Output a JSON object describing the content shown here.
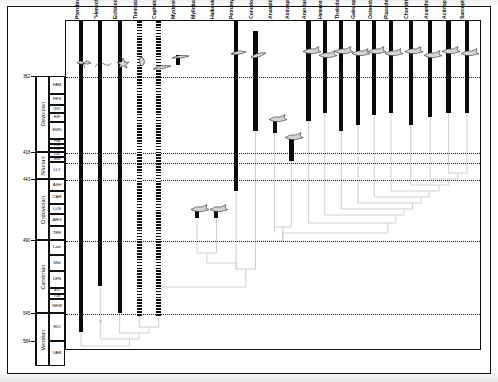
{
  "figure": {
    "type": "stratigraphic-range-cladogram",
    "axis_unit": "Ma",
    "bar_legend": {
      "solid": "known fossil record",
      "hatched": "uncertain / inferred record",
      "ghost": "ghost lineage"
    }
  },
  "age_ticks": [
    {
      "label": "362",
      "y": 76
    },
    {
      "label": "418",
      "y": 152
    },
    {
      "label": "443",
      "y": 179
    },
    {
      "label": "490",
      "y": 240
    },
    {
      "label": "545",
      "y": 313
    },
    {
      "label": "584",
      "y": 341
    }
  ],
  "periods": [
    {
      "name": "Devonian",
      "top": 76,
      "bottom": 152
    },
    {
      "name": "Silurian",
      "top": 152,
      "bottom": 179
    },
    {
      "name": "Ordovician",
      "top": 179,
      "bottom": 240
    },
    {
      "name": "Cambrian",
      "top": 240,
      "bottom": 313
    },
    {
      "name": "Vendian",
      "top": 313,
      "bottom": 366
    }
  ],
  "stages": [
    {
      "label": "FAM",
      "top": 76,
      "bottom": 94
    },
    {
      "label": "FRS",
      "top": 94,
      "bottom": 105
    },
    {
      "label": "GIV",
      "top": 105,
      "bottom": 113
    },
    {
      "label": "EIF",
      "top": 113,
      "bottom": 122
    },
    {
      "label": "EMS",
      "top": 122,
      "bottom": 139
    },
    {
      "label": "PRA",
      "top": 139,
      "bottom": 144,
      "tiny": true
    },
    {
      "label": "LOK",
      "top": 144,
      "bottom": 148,
      "tiny": true
    },
    {
      "label": "PRD",
      "top": 148,
      "bottom": 152,
      "tiny": true
    },
    {
      "label": "LUD",
      "top": 152,
      "bottom": 157,
      "tiny": true
    },
    {
      "label": "WEN",
      "top": 157,
      "bottom": 162,
      "tiny": true
    },
    {
      "label": "LLY",
      "top": 162,
      "bottom": 179
    },
    {
      "label": "ASH",
      "top": 179,
      "bottom": 191
    },
    {
      "label": "CAR",
      "top": 191,
      "bottom": 204
    },
    {
      "label": "LLN",
      "top": 204,
      "bottom": 214
    },
    {
      "label": "ARG",
      "top": 214,
      "bottom": 226
    },
    {
      "label": "TRE",
      "top": 226,
      "bottom": 240
    },
    {
      "label": "Late",
      "top": 240,
      "bottom": 255
    },
    {
      "label": "Mid",
      "top": 255,
      "bottom": 271
    },
    {
      "label": "LEN",
      "top": 271,
      "bottom": 288
    },
    {
      "label": "ATD",
      "top": 288,
      "bottom": 294,
      "tiny": true
    },
    {
      "label": "TOM",
      "top": 294,
      "bottom": 299,
      "tiny": true
    },
    {
      "label": "NEM",
      "top": 299,
      "bottom": 313
    },
    {
      "label": "EDI",
      "top": 313,
      "bottom": 341
    },
    {
      "label": "VAR",
      "top": 341,
      "bottom": 366
    }
  ],
  "boundaries_y": [
    76,
    152,
    162,
    179,
    240,
    313
  ],
  "taxa": [
    {
      "name": "Pterobranchia",
      "x": 18,
      "bar_top": 0,
      "bar_bottom": 311,
      "style": "solid",
      "width": 4.0,
      "critter": "plume",
      "critter_y": 36
    },
    {
      "name": "\"Hemichordata\"",
      "x": 45,
      "bar_top": 0,
      "bar_bottom": 265,
      "style": "solid",
      "width": 4.0,
      "critter": "worm",
      "critter_y": 38
    },
    {
      "name": "Echinodermata",
      "x": 72,
      "bar_top": 0,
      "bar_bottom": 292,
      "style": "solid",
      "width": 4.0,
      "critter": "star",
      "critter_y": 36
    },
    {
      "name": "Tunicata",
      "x": 99,
      "bar_top": 0,
      "bar_bottom": 295,
      "style": "hatch",
      "width": 4.6,
      "critter": "tunic",
      "critter_y": 34
    },
    {
      "name": "Cephalochordata",
      "x": 126,
      "bar_top": 0,
      "bar_bottom": 296,
      "style": "hatch",
      "width": 4.6,
      "critter": "lance",
      "critter_y": 40
    },
    {
      "name": "Myxinoidea",
      "x": 153,
      "bar_top": 34,
      "bar_bottom": 44,
      "style": "solid",
      "width": 4.0,
      "critter": "hag",
      "critter_y": 30
    },
    {
      "name": "Myllokunmingia",
      "x": 180,
      "bar_top": 190,
      "bar_bottom": 197,
      "style": "solid",
      "width": 4.0,
      "critter": "fish1",
      "critter_y": 182
    },
    {
      "name": "Haikouichthys",
      "x": 207,
      "bar_top": 190,
      "bar_bottom": 197,
      "style": "solid",
      "width": 4.0,
      "critter": "fish1",
      "critter_y": 182
    },
    {
      "name": "Petromyzontida",
      "x": 234,
      "bar_top": 0,
      "bar_bottom": 170,
      "style": "solid",
      "width": 4.6,
      "critter": "lamp",
      "critter_y": 26
    },
    {
      "name": "Conodonta",
      "x": 261,
      "bar_top": 10,
      "bar_bottom": 110,
      "style": "solid",
      "width": 4.6,
      "critter": "cono",
      "critter_y": 28
    },
    {
      "name": "Anaspida",
      "x": 288,
      "bar_top": 100,
      "bar_bottom": 112,
      "style": "solid",
      "width": 4.0,
      "critter": "anas",
      "critter_y": 92
    },
    {
      "name": "Astraspida",
      "x": 311,
      "bar_top": 117,
      "bar_bottom": 140,
      "style": "solid",
      "width": 4.6,
      "critter": "astr",
      "critter_y": 110
    },
    {
      "name": "Arandaspida",
      "x": 335,
      "bar_top": 0,
      "bar_bottom": 100,
      "style": "solid",
      "width": 4.6,
      "critter": "aran",
      "critter_y": 24
    },
    {
      "name": "Heterostraci",
      "x": 358,
      "bar_top": 0,
      "bar_bottom": 92,
      "style": "solid",
      "width": 4.0,
      "critter": "het",
      "critter_y": 28
    },
    {
      "name": "Thelodonti",
      "x": 381,
      "bar_top": 0,
      "bar_bottom": 110,
      "style": "solid",
      "width": 4.0,
      "critter": "thel",
      "critter_y": 24
    },
    {
      "name": "Galeaspida",
      "x": 404,
      "bar_top": 0,
      "bar_bottom": 104,
      "style": "solid",
      "width": 4.6,
      "critter": "gale",
      "critter_y": 26
    },
    {
      "name": "Osteostraci",
      "x": 427,
      "bar_top": 0,
      "bar_bottom": 94,
      "style": "solid",
      "width": 4.0,
      "critter": "oste",
      "critter_y": 24
    },
    {
      "name": "Placodermi",
      "x": 450,
      "bar_top": 0,
      "bar_bottom": 92,
      "style": "solid",
      "width": 4.6,
      "critter": "plac",
      "critter_y": 26
    },
    {
      "name": "Chondrichthyes",
      "x": 478,
      "bar_top": 0,
      "bar_bottom": 104,
      "style": "solid",
      "width": 4.0,
      "critter": "shark",
      "critter_y": 24
    },
    {
      "name": "Acanthodii",
      "x": 505,
      "bar_top": 0,
      "bar_bottom": 96,
      "style": "solid",
      "width": 4.0,
      "critter": "acan",
      "critter_y": 28
    },
    {
      "name": "Actinopterygii",
      "x": 530,
      "bar_top": 0,
      "bar_bottom": 92,
      "style": "solid",
      "width": 4.6,
      "critter": "acti",
      "critter_y": 24
    },
    {
      "name": "Sarcopterygii",
      "x": 556,
      "bar_top": 0,
      "bar_bottom": 92,
      "style": "solid",
      "width": 4.6,
      "critter": "sarc",
      "critter_y": 26
    }
  ],
  "question_mark": "?"
}
